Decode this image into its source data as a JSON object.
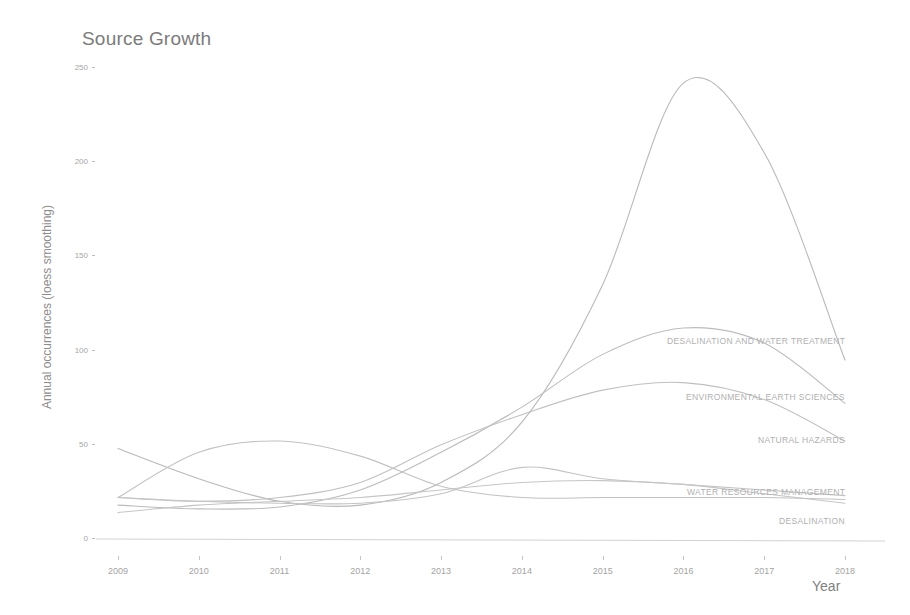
{
  "chart_data": {
    "type": "line",
    "title": "Source Growth",
    "xlabel": "Year",
    "ylabel": "Annual occurrences (loess smoothing)",
    "x": [
      2009,
      2010,
      2011,
      2012,
      2013,
      2014,
      2015,
      2016,
      2017,
      2018
    ],
    "xlim": [
      2009,
      2018
    ],
    "ylim": [
      0,
      250
    ],
    "yticks": [
      0,
      50,
      100,
      150,
      200,
      250
    ],
    "xticks": [
      "2009",
      "2010",
      "2011",
      "2012",
      "2013",
      "2014",
      "2015",
      "2016",
      "2017",
      "2018"
    ],
    "grid": false,
    "legend_position": "inline-right-of-line-end",
    "smoothing": "loess",
    "series": [
      {
        "name": "DESALINATION AND WATER TREATMENT",
        "label": "DESALINATION AND WATER TREATMENT",
        "color": "#b9b9b9",
        "values": [
          48,
          32,
          20,
          18,
          30,
          62,
          135,
          242,
          205,
          95
        ],
        "peak_value": 245,
        "peak_year": 2015.8,
        "end_value": 95
      },
      {
        "name": "ENVIRONMENTAL EARTH SCIENCES",
        "label": "ENVIRONMENTAL EARTH SCIENCES",
        "color": "#bcbcbc",
        "values": [
          18,
          16,
          17,
          26,
          46,
          70,
          98,
          112,
          104,
          72
        ],
        "peak_value": 112,
        "peak_year": 2016,
        "end_value": 72
      },
      {
        "name": "NATURAL HAZARDS",
        "label": "NATURAL HAZARDS",
        "color": "#c0c0c0",
        "values": [
          22,
          20,
          22,
          30,
          50,
          66,
          79,
          83,
          74,
          52
        ],
        "peak_value": 83,
        "peak_year": 2015.4,
        "end_value": 52
      },
      {
        "name": "WATER RESOURCES MANAGEMENT",
        "label": "WATER RESOURCES MANAGEMENT",
        "color": "#c4c4c4",
        "values": [
          22,
          20,
          19,
          19,
          24,
          38,
          32,
          29,
          26,
          23
        ],
        "peak_value": 38,
        "peak_year": 2014,
        "end_value": 23
      },
      {
        "name": "DESALINATION",
        "label": "DESALINATION",
        "color": "#c6c6c6",
        "values": [
          14,
          18,
          20,
          22,
          26,
          30,
          31,
          29,
          24,
          19
        ],
        "peak_value": 31,
        "peak_year": 2015,
        "end_value": 19
      },
      {
        "name": "RISING EARLY SERIES",
        "label": "",
        "color": "#c2c2c2",
        "values": [
          22,
          46,
          52,
          44,
          28,
          22,
          22,
          22,
          22,
          21
        ],
        "peak_value": 52,
        "peak_year": 2010.7,
        "end_value": 21
      }
    ]
  },
  "axis": {
    "baseline_color": "#d2d2d2"
  }
}
